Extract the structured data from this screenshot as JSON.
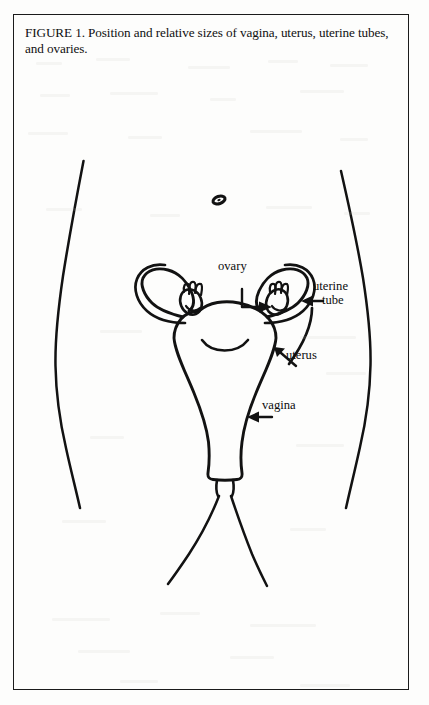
{
  "figure": {
    "caption": "FIGURE 1. Position and relative sizes of vagina, uterus, uterine tubes, and ovaries.",
    "number": "FIGURE 1",
    "page_background": "#fdfdfc",
    "ink_color": "#101010",
    "border_color": "#1b1b1b"
  },
  "labels": {
    "ovary": "ovary",
    "uterine_tube_line1": "uterine",
    "uterine_tube_line2": "tube",
    "uterus": "uterus",
    "vagina": "vagina"
  },
  "anatomy": {
    "parts": [
      "left-body-outline",
      "right-body-outline",
      "navel",
      "uterus-body",
      "left-uterine-tube",
      "right-uterine-tube",
      "left-ovary",
      "right-ovary",
      "vagina-canal",
      "left-inner-thigh",
      "right-inner-thigh"
    ]
  }
}
